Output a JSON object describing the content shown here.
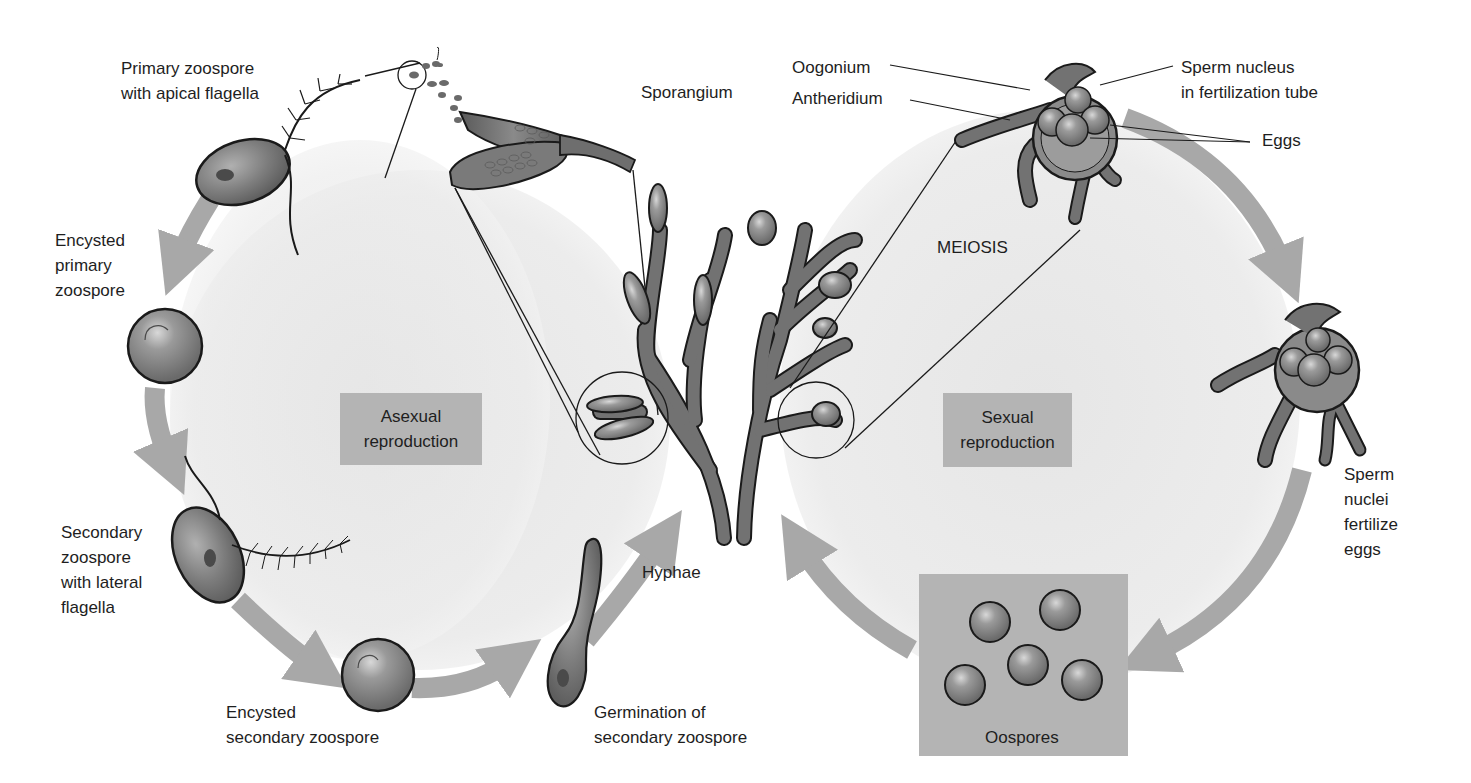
{
  "diagram": {
    "regions": {
      "asexual": {
        "label": "Asexual\nreproduction"
      },
      "sexual": {
        "label": "Sexual\nreproduction"
      }
    },
    "center": {
      "label": "Hyphae"
    },
    "asexual_stages": [
      {
        "id": "primary-zoospore",
        "label": "Primary zoospore\nwith apical flagella"
      },
      {
        "id": "encysted-primary",
        "label": "Encysted\nprimary\nzoospore"
      },
      {
        "id": "secondary-zoospore",
        "label": "Secondary\nzoospore\nwith lateral\nflagella"
      },
      {
        "id": "encysted-secondary",
        "label": "Encysted\nsecondary zoospore"
      },
      {
        "id": "germination",
        "label": "Germination of\nsecondary zoospore"
      }
    ],
    "structures": {
      "sporangium": "Sporangium",
      "oogonium": "Oogonium",
      "antheridium": "Antheridium",
      "sperm_nucleus": "Sperm nucleus\nin fertilization tube",
      "eggs": "Eggs",
      "meiosis": "MEIOSIS",
      "fertilize": "Sperm\nnuclei\nfertilize\neggs",
      "oospores": "Oospores"
    },
    "colors": {
      "background_blob": "#ebebeb",
      "label_box": "#b4b4b4",
      "arrow": "#a8a8a8",
      "cell_fill": "#7c7c7c",
      "hypha_fill": "#6e6e6e",
      "outline": "#1a1a1a"
    }
  }
}
